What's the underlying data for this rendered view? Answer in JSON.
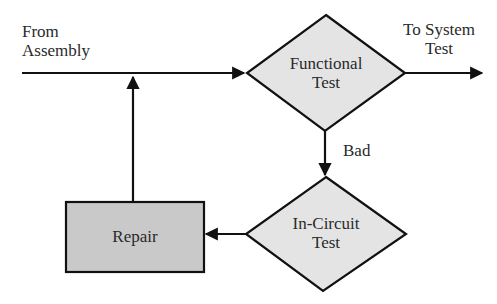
{
  "diagram": {
    "type": "flowchart",
    "colors": {
      "stroke": "#111111",
      "diamond_fill": "#e4e4e4",
      "process_fill": "#c9c9c9",
      "background": "#ffffff",
      "text": "#2a2a2a"
    },
    "labels": {
      "input_line1": "From",
      "input_line2": "Assembly",
      "output_line1": "To System",
      "output_line2": "Test",
      "bad_edge": "Bad"
    },
    "nodes": {
      "functional_test": {
        "shape": "diamond",
        "line1": "Functional",
        "line2": "Test"
      },
      "in_circuit_test": {
        "shape": "diamond",
        "line1": "In-Circuit",
        "line2": "Test"
      },
      "repair": {
        "shape": "rectangle",
        "label": "Repair"
      }
    },
    "edges": [
      {
        "from": "From Assembly",
        "to": "Functional Test",
        "label": ""
      },
      {
        "from": "Functional Test",
        "to": "To System Test",
        "label": ""
      },
      {
        "from": "Functional Test",
        "to": "In-Circuit Test",
        "label": "Bad"
      },
      {
        "from": "In-Circuit Test",
        "to": "Repair",
        "label": ""
      },
      {
        "from": "Repair",
        "to": "From Assembly line",
        "label": ""
      }
    ]
  }
}
